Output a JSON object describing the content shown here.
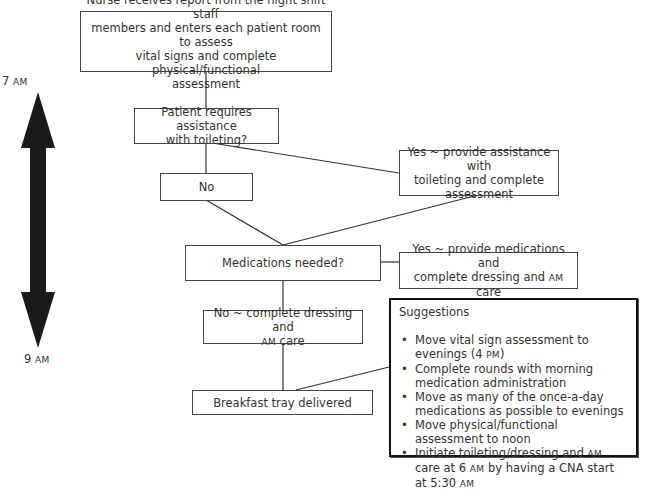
{
  "timeline": {
    "start_label": "7",
    "start_suffix": "AM",
    "end_label": "9",
    "end_suffix": "AM"
  },
  "nodes": {
    "start": {
      "lines": [
        "Nurse receives report from the night shift staff",
        "members and enters each patient room to assess",
        "vital signs and complete physical/functional",
        "assessment"
      ]
    },
    "toileting_question": {
      "lines": [
        "Patient requires assistance",
        "with toileting?"
      ]
    },
    "toileting_no": {
      "text": "No"
    },
    "toileting_yes": {
      "lines": [
        "Yes ~ provide assistance with",
        "toileting and complete",
        "assessment"
      ]
    },
    "medications_question": {
      "text": "Medications needed?"
    },
    "medications_yes": {
      "line1": "Yes ~ provide medications  and",
      "line2_pre": "complete dressing and ",
      "line2_sc": "AM",
      "line2_post": " care"
    },
    "medications_no": {
      "line1": "No ~ complete dressing and",
      "line2_sc": "AM",
      "line2_post": " care"
    },
    "breakfast": {
      "text": "Breakfast tray delivered"
    }
  },
  "suggestions": {
    "title": "Suggestions",
    "items": [
      {
        "pre": "Move vital sign assessment to evenings (4 ",
        "sc": "PM",
        "post": ")"
      },
      {
        "pre": "Complete rounds with morning medication administration"
      },
      {
        "pre": "Move as many of the once-a-day medications as possible to evenings"
      },
      {
        "pre": "Move physical/functional assessment to noon"
      },
      {
        "pre": "Initiate toileting/dressing and ",
        "sc": "AM",
        "post": " care at 6 ",
        "sc2": "AM",
        "post2": " by having a CNA start at 5:30 ",
        "sc3": "AM"
      }
    ]
  }
}
